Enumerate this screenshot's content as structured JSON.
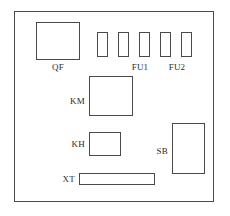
{
  "diagram": {
    "enclosure": {
      "name": "control-panel-enclosure",
      "x": 14,
      "y": 11,
      "width": 200,
      "height": 191
    },
    "stroke_color": "#4a4a4a",
    "background_color": "#ffffff",
    "text_color": "#2b2b2b",
    "components": [
      {
        "id": "QF",
        "label": "QF",
        "description": "circuit-breaker",
        "shape": "rectangle",
        "x": 36,
        "y": 22,
        "width": 44,
        "height": 38,
        "label_x": 36,
        "label_y": 62,
        "label_width": 44,
        "label_align": "center"
      },
      {
        "id": "KM",
        "label": "KM",
        "description": "contactor",
        "shape": "rectangle",
        "x": 89,
        "y": 76,
        "width": 44,
        "height": 40,
        "label_x": 57,
        "label_y": 96,
        "label_width": 28,
        "label_align": "right"
      },
      {
        "id": "KH",
        "label": "KH",
        "description": "thermal-overload-relay",
        "shape": "rectangle",
        "x": 89,
        "y": 132,
        "width": 32,
        "height": 24,
        "label_x": 57,
        "label_y": 139,
        "label_width": 28,
        "label_align": "right"
      },
      {
        "id": "SB",
        "label": "SB",
        "description": "push-button-station",
        "shape": "rectangle",
        "x": 172,
        "y": 123,
        "width": 33,
        "height": 51,
        "label_x": 140,
        "label_y": 146,
        "label_width": 28,
        "label_align": "right"
      },
      {
        "id": "XT",
        "label": "XT",
        "description": "terminal-block-strip",
        "shape": "rectangle",
        "x": 79,
        "y": 173,
        "width": 76,
        "height": 12,
        "label_x": 47,
        "label_y": 174,
        "label_width": 28,
        "label_align": "right"
      }
    ],
    "fuses": {
      "group_label_1": "FU1",
      "group_label_2": "FU2",
      "items": [
        {
          "id": "fuse-1",
          "x": 97,
          "y": 32,
          "width": 11,
          "height": 25
        },
        {
          "id": "fuse-2",
          "x": 118,
          "y": 32,
          "width": 11,
          "height": 25
        },
        {
          "id": "fuse-3",
          "x": 139,
          "y": 32,
          "width": 11,
          "height": 25
        },
        {
          "id": "fuse-4",
          "x": 160,
          "y": 32,
          "width": 11,
          "height": 25
        },
        {
          "id": "fuse-5",
          "x": 181,
          "y": 32,
          "width": 11,
          "height": 25
        }
      ],
      "labels": [
        {
          "text": "FU1",
          "x": 128,
          "y": 62,
          "width": 24,
          "align": "center"
        },
        {
          "text": "FU2",
          "x": 165,
          "y": 62,
          "width": 24,
          "align": "center"
        }
      ]
    }
  }
}
